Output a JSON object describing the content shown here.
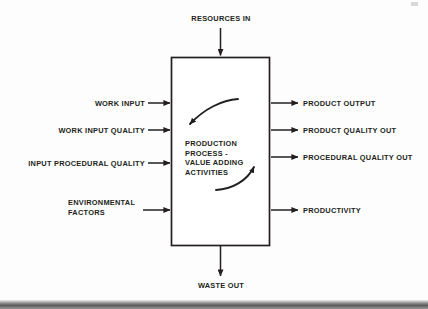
{
  "diagram": {
    "title": "Production Process - Value Adding Activities",
    "process_box": {
      "name": "production-process-box",
      "lines": [
        "PRODUCTION",
        "PROCESS -",
        "VALUE ADDING",
        "ACTIVITIES"
      ],
      "text": "PRODUCTION PROCESS - VALUE ADDING ACTIVITIES"
    },
    "top_input": {
      "label": "RESOURCES IN",
      "direction": "down-into-box"
    },
    "bottom_output": {
      "label": "WASTE OUT",
      "direction": "down-out-of-box"
    },
    "left_inputs": [
      {
        "label": "WORK INPUT",
        "lines": [
          "WORK INPUT"
        ]
      },
      {
        "label": "WORK INPUT QUALITY",
        "lines": [
          "WORK INPUT QUALITY"
        ]
      },
      {
        "label": "INPUT PROCEDURAL QUALITY",
        "lines": [
          "INPUT PROCEDURAL QUALITY"
        ]
      },
      {
        "label": "ENVIRONMENTAL FACTORS",
        "lines": [
          "ENVIRONMENTAL",
          "FACTORS"
        ]
      }
    ],
    "right_outputs": [
      {
        "label": "PRODUCT OUTPUT"
      },
      {
        "label": "PRODUCT QUALITY OUT"
      },
      {
        "label": "PROCEDURAL QUALITY OUT"
      },
      {
        "label": "PRODUCTIVITY"
      }
    ],
    "internal_arrows": [
      {
        "name": "upper-curved-arrow",
        "description": "curved arrow sweeping from upper right to lower left"
      },
      {
        "name": "lower-curved-arrow",
        "description": "curved arrow sweeping from lower left to upper right"
      }
    ],
    "colors": {
      "ink": "#231f20",
      "background": "#fdfdfd",
      "scan_edge": "#5b5b5b"
    }
  }
}
